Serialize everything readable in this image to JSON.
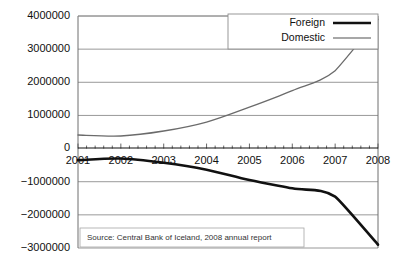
{
  "chart_data": {
    "type": "line",
    "title": "",
    "subtitle": "",
    "xlabel": "",
    "ylabel": "",
    "x": [
      2001,
      2002,
      2003,
      2004,
      2005,
      2006,
      2007,
      2008
    ],
    "categories": [
      "2001",
      "2002",
      "2003",
      "2004",
      "2005",
      "2006",
      "2007",
      "2008"
    ],
    "series": [
      {
        "name": "Foreign",
        "color": "#111111",
        "values": [
          -350000,
          -300000,
          -430000,
          -640000,
          -950000,
          -1200000,
          -1450000,
          -2900000
        ]
      },
      {
        "name": "Domestic",
        "color": "#6b6b6b",
        "values": [
          410000,
          380000,
          530000,
          800000,
          1250000,
          1750000,
          2350000,
          3900000
        ]
      }
    ],
    "xlim": [
      2001,
      2008
    ],
    "ylim": [
      -3000000,
      4000000
    ],
    "ytick_values": [
      4000000,
      3000000,
      2000000,
      1000000,
      0,
      -1000000,
      -2000000,
      -3000000
    ],
    "ytick_labels": [
      "4000000",
      "3000000",
      "2000000",
      "1000000",
      "0",
      "−1000000",
      "−2000000",
      "−3000000"
    ],
    "xtick_labels": [
      "2001",
      "2002",
      "2003",
      "2004",
      "2005",
      "2006",
      "2007",
      "2008"
    ],
    "minor_ticks_per_interval": 4,
    "grid": true,
    "grid_axis": "y",
    "legend_position": "top-right",
    "legend_entries": [
      "Foreign",
      "Domestic"
    ],
    "annotations": [
      {
        "name": "source-note",
        "text": "Source: Central Bank of Iceland, 2008 annual report"
      }
    ]
  },
  "legend": {
    "entries": [
      {
        "label": "Foreign",
        "style": "thick-black-line"
      },
      {
        "label": "Domestic",
        "style": "thin-gray-line"
      }
    ]
  },
  "source_note": {
    "text": "Source: Central Bank of Iceland, 2008 annual report"
  },
  "colors": {
    "foreign": "#111111",
    "domestic": "#6b6b6b",
    "gridline": "#8d8d8d",
    "frame": "#6f6f6f",
    "background": "#ffffff"
  }
}
